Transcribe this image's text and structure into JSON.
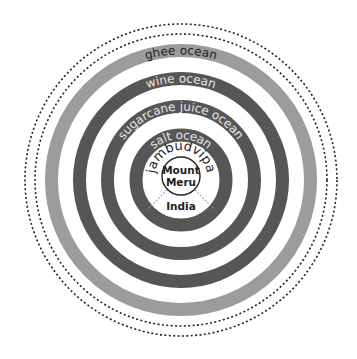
{
  "rings": [
    {
      "id": "ghee-ocean",
      "label": "ghee ocean",
      "shade": "light",
      "color": "#9c9c9c",
      "text_color": "#222222"
    },
    {
      "id": "wine-ocean",
      "label": "wine ocean",
      "shade": "dark",
      "color": "#565656",
      "text_color": "#e6e6e6"
    },
    {
      "id": "sugarcane-juice-ocean",
      "label": "sugarcane juice ocean",
      "shade": "dark",
      "color": "#565656",
      "text_color": "#e6e6e6"
    },
    {
      "id": "salt-ocean",
      "label": "salt ocean",
      "shade": "dark",
      "color": "#565656",
      "text_color": "#e6e6e6"
    }
  ],
  "continent": {
    "label": "jambudvipa"
  },
  "center": {
    "label_line1": "Mount",
    "label_line2": "Meru"
  },
  "region": {
    "label": "India"
  },
  "boundary_style": "dotted"
}
